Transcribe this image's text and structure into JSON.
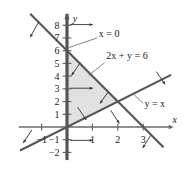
{
  "figure": {
    "name": "linear-inequality-feasible-region-graph",
    "background": "#ffffff",
    "width": 191,
    "height": 175
  },
  "chart_data": {
    "type": "line",
    "title": "",
    "xlabel": "x",
    "ylabel": "y",
    "xlim": [
      -1.9,
      4.2
    ],
    "ylim": [
      -2.6,
      8.9
    ],
    "grid": false,
    "legend_position": "inline-annotations",
    "x_ticks": [
      -1,
      1,
      2,
      3
    ],
    "x_tick_labels": [
      "−1",
      "1",
      "2",
      "3"
    ],
    "y_ticks": [
      8,
      7,
      6,
      5,
      4,
      3,
      2,
      1,
      -1,
      -2
    ],
    "y_tick_labels": [
      "8",
      "7",
      "6",
      "5",
      "4",
      "3",
      "2",
      "1",
      "−1",
      "−2"
    ],
    "series": [
      {
        "name": "x = 0",
        "label": "x = 0",
        "equation": "x = 0",
        "kind": "vertical-boundary-line",
        "color": "#555555",
        "width": 3.2,
        "points": [
          [
            0,
            -2.6
          ],
          [
            0,
            8.9
          ]
        ]
      },
      {
        "name": "2x + y = 6",
        "label": "2x + y = 6",
        "equation": "2x + y = 6",
        "kind": "boundary-line",
        "slope": -2,
        "intercept": 6,
        "color": "#555555",
        "width": 2.1,
        "points": [
          [
            -1.45,
            8.9
          ],
          [
            3.8,
            -1.6
          ]
        ]
      },
      {
        "name": "y = x",
        "label": "y = x",
        "equation": "y = x",
        "kind": "boundary-line",
        "slope": 1,
        "intercept": 0,
        "color": "#555555",
        "width": 2.1,
        "points": [
          [
            -1.85,
            -1.85
          ],
          [
            4.1,
            4.1
          ]
        ]
      }
    ],
    "shaded_region": {
      "name": "feasible-region",
      "vertices": [
        [
          0,
          0
        ],
        [
          0,
          6
        ],
        [
          2,
          2
        ]
      ],
      "fill": "#dcdcdc",
      "opacity": 0.85,
      "description": "triangle bounded by x = 0, 2x + y = 6, and y = x"
    },
    "annotations": [
      {
        "name": "x-equals-zero-label",
        "text": "x = 0",
        "x": 1.25,
        "y": 7.05
      },
      {
        "name": "two-x-plus-y-label",
        "text": "2x + y = 6",
        "x": 1.55,
        "y": 5.35
      },
      {
        "name": "y-equals-x-label",
        "text": "y = x",
        "x": 3.05,
        "y": 1.55
      }
    ],
    "direction_arrows": [
      {
        "name": "arrow-x0-top",
        "from": [
          0.12,
          8.05
        ],
        "to": [
          1.02,
          8.05
        ]
      },
      {
        "name": "arrow-x0-mid",
        "from": [
          0.12,
          3.05
        ],
        "to": [
          1.02,
          3.05
        ]
      },
      {
        "name": "arrow-x0-bottom",
        "from": [
          0.12,
          -1.05
        ],
        "to": [
          1.02,
          -1.05
        ]
      },
      {
        "name": "arrow-line6-upper",
        "from": [
          -1.12,
          8.25
        ],
        "to": [
          -1.45,
          7.05
        ]
      },
      {
        "name": "arrow-line6-shade",
        "from": [
          0.52,
          5.05
        ],
        "to": [
          0.18,
          4.05
        ]
      },
      {
        "name": "arrow-line6-inner",
        "from": [
          1.62,
          2.75
        ],
        "to": [
          1.3,
          1.85
        ]
      },
      {
        "name": "arrow-line6-lower",
        "from": [
          3.3,
          -0.65
        ],
        "to": [
          2.98,
          -1.65
        ]
      },
      {
        "name": "arrow-yx-left",
        "from": [
          -1.38,
          -0.22
        ],
        "to": [
          -1.72,
          -1.25
        ]
      },
      {
        "name": "arrow-yx-inner",
        "from": [
          0.42,
          1.55
        ],
        "to": [
          0.76,
          0.55
        ]
      },
      {
        "name": "arrow-yx-mid",
        "from": [
          1.72,
          1.3
        ],
        "to": [
          2.06,
          0.28
        ]
      },
      {
        "name": "arrow-yx-right",
        "from": [
          3.52,
          4.35
        ],
        "to": [
          3.86,
          3.35
        ]
      }
    ],
    "axis_labels": {
      "x": "x",
      "y": "y"
    }
  }
}
